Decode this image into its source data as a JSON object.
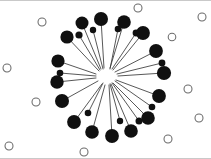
{
  "figure": {
    "width": 211,
    "height": 159,
    "background_color": "#ffffff"
  },
  "chart_data": {
    "type": "scatter",
    "title": "",
    "xlabel": "",
    "ylabel": "",
    "xlim": [
      0,
      211
    ],
    "ylim": [
      0,
      159
    ],
    "grid": false,
    "legend": "none",
    "layout": "radial-star",
    "hub": {
      "label": "center-hub",
      "x": 108,
      "y": 76,
      "radius": 2,
      "color": "#ffffff",
      "filled": false,
      "degree": 26
    },
    "edge_style": {
      "color": "#3a3a3a",
      "width": 0.85,
      "shape": "straight"
    },
    "series": [
      {
        "name": "hub-connected-nodes",
        "marker": "filled-circle",
        "color": "#101010",
        "values": [
          {
            "id": "n1",
            "x": 101,
            "y": 19,
            "r": 7.0,
            "edge_start_x": 104,
            "edge_start_y": 68
          },
          {
            "id": "n2",
            "x": 82,
            "y": 23,
            "r": 6.5,
            "edge_start_x": 101,
            "edge_start_y": 69
          },
          {
            "id": "n3",
            "x": 124,
            "y": 22,
            "r": 6.8,
            "edge_start_x": 110,
            "edge_start_y": 68
          },
          {
            "id": "n4",
            "x": 67,
            "y": 37,
            "r": 6.6,
            "edge_start_x": 99,
            "edge_start_y": 71
          },
          {
            "id": "n5",
            "x": 79,
            "y": 35,
            "r": 3.6,
            "edge_start_x": 100,
            "edge_start_y": 70
          },
          {
            "id": "n6",
            "x": 136,
            "y": 33,
            "r": 3.4,
            "edge_start_x": 112,
            "edge_start_y": 69
          },
          {
            "id": "n7",
            "x": 143,
            "y": 33,
            "r": 6.9,
            "edge_start_x": 113,
            "edge_start_y": 70
          },
          {
            "id": "n8",
            "x": 58,
            "y": 61,
            "r": 6.6,
            "edge_start_x": 96,
            "edge_start_y": 74
          },
          {
            "id": "n9",
            "x": 156,
            "y": 51,
            "r": 6.9,
            "edge_start_x": 115,
            "edge_start_y": 72
          },
          {
            "id": "n10",
            "x": 60,
            "y": 73,
            "r": 3.3,
            "edge_start_x": 96,
            "edge_start_y": 76
          },
          {
            "id": "n11",
            "x": 162,
            "y": 63,
            "r": 3.4,
            "edge_start_x": 117,
            "edge_start_y": 74
          },
          {
            "id": "n12",
            "x": 57,
            "y": 82,
            "r": 6.7,
            "edge_start_x": 96,
            "edge_start_y": 78
          },
          {
            "id": "n13",
            "x": 164,
            "y": 73,
            "r": 7.1,
            "edge_start_x": 118,
            "edge_start_y": 76
          },
          {
            "id": "n14",
            "x": 62,
            "y": 101,
            "r": 7.0,
            "edge_start_x": 98,
            "edge_start_y": 81
          },
          {
            "id": "n15",
            "x": 159,
            "y": 96,
            "r": 6.9,
            "edge_start_x": 116,
            "edge_start_y": 80
          },
          {
            "id": "n16",
            "x": 74,
            "y": 122,
            "r": 6.9,
            "edge_start_x": 102,
            "edge_start_y": 84
          },
          {
            "id": "n17",
            "x": 148,
            "y": 118,
            "r": 6.8,
            "edge_start_x": 113,
            "edge_start_y": 83
          },
          {
            "id": "n18",
            "x": 92,
            "y": 132,
            "r": 6.8,
            "edge_start_x": 105,
            "edge_start_y": 85
          },
          {
            "id": "n19",
            "x": 112,
            "y": 136,
            "r": 6.9,
            "edge_start_x": 109,
            "edge_start_y": 85
          },
          {
            "id": "n20",
            "x": 131,
            "y": 131,
            "r": 6.8,
            "edge_start_x": 111,
            "edge_start_y": 84
          },
          {
            "id": "n21",
            "x": 139,
            "y": 121,
            "r": 3.5,
            "edge_start_x": 112,
            "edge_start_y": 83
          },
          {
            "id": "n22",
            "x": 120,
            "y": 121,
            "r": 3.2,
            "edge_start_x": 110,
            "edge_start_y": 84
          },
          {
            "id": "n23",
            "x": 88,
            "y": 113,
            "r": 3.3,
            "edge_start_x": 103,
            "edge_start_y": 83
          },
          {
            "id": "n24",
            "x": 152,
            "y": 107,
            "r": 3.3,
            "edge_start_x": 115,
            "edge_start_y": 81
          },
          {
            "id": "n25",
            "x": 118,
            "y": 29,
            "r": 3.3,
            "edge_start_x": 110,
            "edge_start_y": 69
          },
          {
            "id": "n26",
            "x": 93,
            "y": 30,
            "r": 3.2,
            "edge_start_x": 103,
            "edge_start_y": 69
          }
        ]
      },
      {
        "name": "isolated-nodes",
        "marker": "hollow-circle",
        "color": "#ffffff",
        "stroke_color": "#6b6b6b",
        "values": [
          {
            "id": "h1",
            "x": 138,
            "y": 8,
            "r": 4.0
          },
          {
            "id": "h2",
            "x": 42,
            "y": 22,
            "r": 4.0
          },
          {
            "id": "h3",
            "x": 202,
            "y": 17,
            "r": 4.0
          },
          {
            "id": "h4",
            "x": 172,
            "y": 37,
            "r": 3.8
          },
          {
            "id": "h5",
            "x": 7,
            "y": 68,
            "r": 4.0
          },
          {
            "id": "h6",
            "x": 188,
            "y": 89,
            "r": 4.0
          },
          {
            "id": "h7",
            "x": 36,
            "y": 102,
            "r": 4.0
          },
          {
            "id": "h8",
            "x": 199,
            "y": 118,
            "r": 4.0
          },
          {
            "id": "h9",
            "x": 168,
            "y": 139,
            "r": 4.0
          },
          {
            "id": "h10",
            "x": 9,
            "y": 146,
            "r": 4.0
          },
          {
            "id": "h11",
            "x": 84,
            "y": 152,
            "r": 4.0
          }
        ]
      }
    ],
    "counts": {
      "filled_nodes": 26,
      "hollow_nodes": 11,
      "edges": 26
    }
  }
}
